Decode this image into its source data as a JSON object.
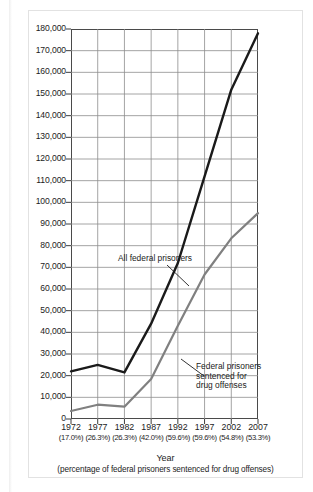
{
  "figure": {
    "x_axis_title": "Year",
    "x_axis_subtitle": "(percentage of federal prisoners sentenced for drug offenses)"
  },
  "annotations": {
    "all_prisoners": "All federal prisoners",
    "drug_line1": "Federal prisoners",
    "drug_line2": "sentenced for",
    "drug_line3": "drug offenses"
  },
  "y_axis": {
    "labels": [
      "180,000",
      "170,000",
      "160,000",
      "150,000",
      "140,000",
      "130,000",
      "120,000",
      "110,000",
      "100,000",
      "90,000",
      "80,000",
      "70,000",
      "60,000",
      "50,000",
      "40,000",
      "30,000",
      "20,000",
      "10,000",
      "0"
    ]
  },
  "x_axis": {
    "years": [
      "1972",
      "1977",
      "1982",
      "1987",
      "1992",
      "1997",
      "2002",
      "2007"
    ],
    "percents": [
      "(17.0%)",
      "(26.3%)",
      "(26.3%)",
      "(42.0%)",
      "(59.6%)",
      "(59.6%)",
      "(54.8%)",
      "(53.3%)"
    ]
  },
  "colors": {
    "series_all": "#1a1a1a",
    "series_drug": "#808080",
    "grid": "#8d8d8d",
    "axis": "#3d3d3d",
    "frame": "#e2e2e2",
    "background": "#ffffff"
  },
  "chart_data": {
    "type": "line",
    "title": "",
    "subtitle": "",
    "xlabel": "Year (percentage of federal prisoners sentenced for drug offenses)",
    "ylabel": "",
    "x": [
      "1972",
      "1977",
      "1982",
      "1987",
      "1992",
      "1997",
      "2002",
      "2007"
    ],
    "x_sublabels": [
      "(17.0%)",
      "(26.3%)",
      "(26.3%)",
      "(42.0%)",
      "(59.6%)",
      "(59.6%)",
      "(54.8%)",
      "(53.3%)"
    ],
    "ylim": [
      0,
      180000
    ],
    "ytick_step": 10000,
    "yticks": [
      0,
      10000,
      20000,
      30000,
      40000,
      50000,
      60000,
      70000,
      80000,
      90000,
      100000,
      110000,
      120000,
      130000,
      140000,
      150000,
      160000,
      170000,
      180000
    ],
    "grid": true,
    "legend": "annotations-inline",
    "series": [
      {
        "name": "All federal prisoners",
        "color": "#1a1a1a",
        "values": [
          22000,
          25000,
          21500,
          44000,
          72000,
          112000,
          152000,
          178000
        ]
      },
      {
        "name": "Federal prisoners sentenced for drug offenses",
        "color": "#808080",
        "values": [
          3700,
          6600,
          5700,
          18500,
          43000,
          66700,
          83400,
          95000
        ]
      }
    ]
  }
}
